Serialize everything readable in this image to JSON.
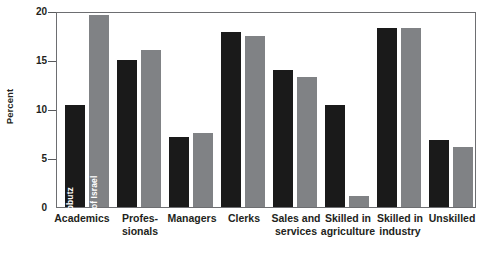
{
  "chart_data": {
    "type": "bar",
    "title": "",
    "xlabel": "",
    "ylabel": "Percent",
    "ylim": [
      0,
      20
    ],
    "yticks": [
      "0",
      "5",
      "10",
      "15",
      "20"
    ],
    "grid": false,
    "legend_position": "inside-first-group-vertical",
    "categories": [
      "Academics",
      "Profes-­sionals",
      "Managers",
      "Clerks",
      "Sales and services",
      "Skilled in agriculture",
      "Skilled in industry",
      "Unskilled"
    ],
    "category_lines": [
      [
        "Academics"
      ],
      [
        "Profes-",
        "sionals"
      ],
      [
        "Managers"
      ],
      [
        "Clerks"
      ],
      [
        "Sales and",
        "services"
      ],
      [
        "Skilled in",
        "agriculture"
      ],
      [
        "Skilled in",
        "industry"
      ],
      [
        "Unskilled"
      ]
    ],
    "series": [
      {
        "name": "Kibbutz",
        "color": "#1a1a1a",
        "values": [
          10.4,
          15.0,
          7.1,
          17.9,
          14.0,
          10.4,
          18.3,
          6.8
        ]
      },
      {
        "name": "Rest of Israel",
        "color": "#808285",
        "values": [
          19.6,
          16.0,
          7.6,
          17.5,
          13.3,
          1.1,
          18.3,
          6.1
        ]
      }
    ]
  },
  "axis": {
    "y_title": "Percent",
    "tick_20": "20",
    "tick_15": "15",
    "tick_10": "10",
    "tick_5": "5",
    "tick_0": "0"
  },
  "legend": {
    "kibbutz": "Kibbutz",
    "rest_of_israel": "Rest of Israel"
  },
  "labels": {
    "c0_l1": "Academics",
    "c1_l1": "Profes-",
    "c1_l2": "sionals",
    "c2_l1": "Managers",
    "c3_l1": "Clerks",
    "c4_l1": "Sales and",
    "c4_l2": "services",
    "c5_l1": "Skilled in",
    "c5_l2": "agriculture",
    "c6_l1": "Skilled in",
    "c6_l2": "industry",
    "c7_l1": "Unskilled"
  },
  "colors": {
    "kibbutz": "#1a1a1a",
    "rest_of_israel": "#808285",
    "frame": "#6d6e71",
    "text": "#231f20",
    "background": "#ffffff"
  }
}
